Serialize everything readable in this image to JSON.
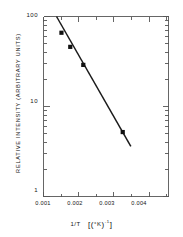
{
  "chart_data": {
    "type": "scatter",
    "title": "",
    "subtitle": "",
    "xlabel": "1/T  [(°K)⁻¹]",
    "ylabel": "RELATIVE INTENSITY (ARBITRARY UNITS)",
    "xscale": "linear",
    "yscale": "log",
    "xlim": [
      0.001,
      0.00455
    ],
    "ylim": [
      1,
      100
    ],
    "grid": false,
    "legend": null,
    "x_tick_labels": [
      "0.001",
      "0.002",
      "0.003",
      "0.004"
    ],
    "x_tick_values": [
      0.001,
      0.002,
      0.003,
      0.004
    ],
    "x_minor_tick_values": [
      0.0015,
      0.0025,
      0.0035,
      0.0045
    ],
    "y_tick_labels": [
      "100",
      "10",
      "1"
    ],
    "y_tick_values": [
      100,
      10,
      1
    ],
    "y_minor_tick_values": [
      2,
      3,
      4,
      5,
      6,
      7,
      8,
      9,
      20,
      30,
      40,
      50,
      60,
      70,
      80,
      90
    ],
    "marker": "filled-square",
    "marker_color": "#111111",
    "line_color": "#1a1a1a",
    "axis_color": "#555555",
    "series": [
      {
        "name": "Relative intensity vs 1/T",
        "x": [
          0.00151,
          0.00176,
          0.00213,
          0.00325
        ],
        "y": [
          66,
          46,
          29,
          5.2
        ]
      }
    ],
    "fit_line": {
      "x_start": 0.00137,
      "y_start": 100,
      "x_end": 0.00348,
      "y_end": 3.6
    }
  },
  "axis_labels": {
    "y_axis_title": "RELATIVE INTENSITY (ARBITRARY UNITS)",
    "x_axis_title_main": "1/T",
    "x_axis_title_unit_open": "[(",
    "x_axis_title_unit_deg": "°K",
    "x_axis_title_unit_close": ")",
    "x_axis_title_unit_exp": "-1",
    "x_axis_title_unit_end": "]"
  }
}
